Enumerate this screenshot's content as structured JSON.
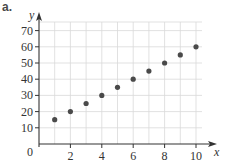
{
  "part_label": "a.",
  "chart_data": {
    "type": "scatter",
    "title": "",
    "xlabel": "x",
    "ylabel": "y",
    "origin_label": "0",
    "xlim": [
      0,
      11.5
    ],
    "ylim": [
      0,
      75
    ],
    "grid": true,
    "x_ticks": [
      2,
      4,
      6,
      8,
      10
    ],
    "y_ticks": [
      10,
      20,
      30,
      40,
      50,
      60,
      70
    ],
    "x_grid_step": 1,
    "y_grid_step": 10,
    "points": [
      {
        "x": 1,
        "y": 15
      },
      {
        "x": 2,
        "y": 20
      },
      {
        "x": 3,
        "y": 25
      },
      {
        "x": 4,
        "y": 30
      },
      {
        "x": 5,
        "y": 35
      },
      {
        "x": 6,
        "y": 40
      },
      {
        "x": 7,
        "y": 45
      },
      {
        "x": 8,
        "y": 50
      },
      {
        "x": 9,
        "y": 55
      },
      {
        "x": 10,
        "y": 60
      }
    ],
    "colors": {
      "point": "#4a4a4a",
      "axis": "#333333",
      "grid": "#d9d9d9"
    }
  }
}
